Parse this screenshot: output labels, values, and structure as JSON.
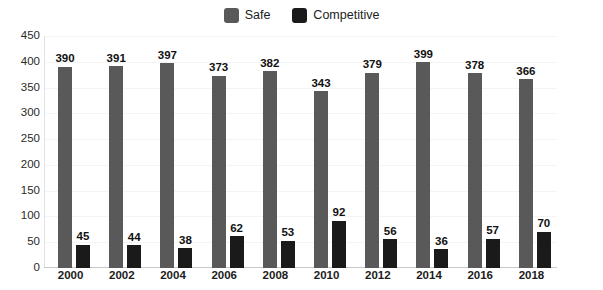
{
  "chart_data": {
    "type": "bar",
    "title": "",
    "subtitle": "",
    "xlabel": "",
    "ylabel": "",
    "categories": [
      "2000",
      "2002",
      "2004",
      "2006",
      "2008",
      "2010",
      "2012",
      "2014",
      "2016",
      "2018"
    ],
    "series": [
      {
        "name": "Safe",
        "color": "#595959",
        "values": [
          390,
          391,
          397,
          373,
          382,
          343,
          379,
          399,
          378,
          366
        ]
      },
      {
        "name": "Competitive",
        "color": "#1a1a1a",
        "values": [
          45,
          44,
          38,
          62,
          53,
          92,
          56,
          36,
          57,
          70
        ]
      }
    ],
    "ylim": [
      0,
      450
    ],
    "yticks": [
      450,
      400,
      350,
      300,
      250,
      200,
      150,
      100,
      50,
      0
    ],
    "ytick_step": 50,
    "grid": true,
    "grid_axis": "y",
    "legend_position": "top-center",
    "annotations": "Each bar is labeled with its value above the bar."
  },
  "legend": {
    "entries": [
      {
        "label": "Safe",
        "color": "#595959"
      },
      {
        "label": "Competitive",
        "color": "#1a1a1a"
      }
    ]
  },
  "colors": {
    "safe": "#595959",
    "competitive": "#1a1a1a",
    "background": "#ffffff",
    "axis": "#c9c9c9",
    "grid": "#f4f4f4",
    "text": "#1c1c1c"
  }
}
